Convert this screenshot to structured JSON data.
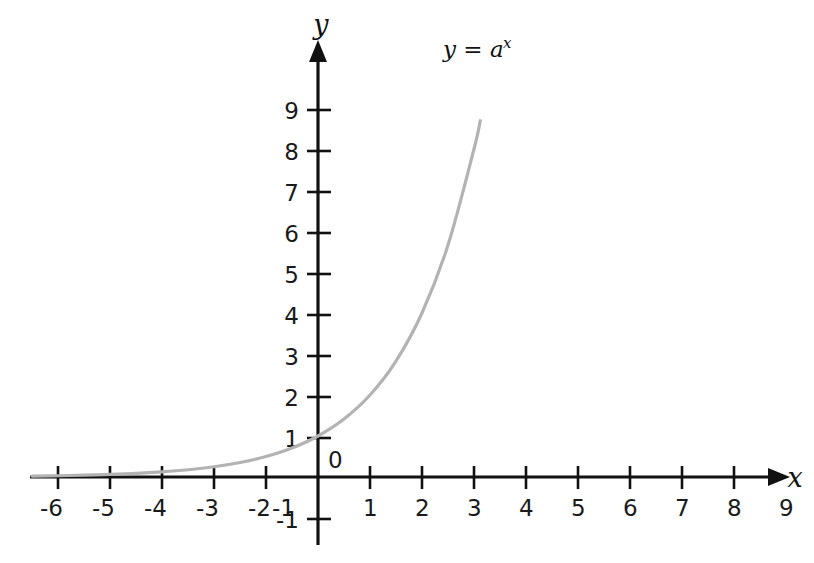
{
  "chart_data": {
    "type": "line",
    "title": "",
    "subtitle": "",
    "xlabel": "x",
    "ylabel": "y",
    "xlim": [
      -6.2,
      9.6
    ],
    "ylim": [
      -1.6,
      10.6
    ],
    "grid": false,
    "legend_position": "none",
    "origin_label": "0",
    "x_ticks": [
      -6,
      -5,
      -4,
      -3,
      -2,
      -1,
      1,
      2,
      3,
      4,
      5,
      6,
      7,
      8,
      9
    ],
    "x_tick_labels": [
      "-6",
      "-5",
      "-4",
      "-3",
      "-2",
      "-1",
      "1",
      "2",
      "3",
      "4",
      "5",
      "6",
      "7",
      "8",
      "9"
    ],
    "y_ticks": [
      -1,
      1,
      2,
      3,
      4,
      5,
      6,
      7,
      8,
      9
    ],
    "y_tick_labels": [
      "-1",
      "1",
      "2",
      "3",
      "4",
      "5",
      "6",
      "7",
      "8",
      "9"
    ],
    "series": [
      {
        "name": "y = a^x",
        "label_base": "y = a",
        "label_exponent": "x",
        "color": "#b3b3b3",
        "base": 2.0,
        "x": [
          -5.5,
          -5.0,
          -4.5,
          -4.0,
          -3.5,
          -3.0,
          -2.5,
          -2.0,
          -1.5,
          -1.0,
          -0.5,
          0.0,
          0.5,
          1.0,
          1.5,
          2.0,
          2.5,
          3.0,
          3.12
        ],
        "values": [
          0.022,
          0.031,
          0.044,
          0.063,
          0.088,
          0.125,
          0.177,
          0.25,
          0.354,
          0.5,
          0.707,
          1.0,
          1.414,
          2.0,
          2.828,
          4.0,
          5.657,
          8.0,
          8.69
        ]
      }
    ],
    "annotations": [
      {
        "text": "y = a^x",
        "x": 3.3,
        "y": 10.3
      }
    ]
  },
  "axes": {
    "x_axis_name": "x",
    "y_axis_name": "y",
    "x_arrow_icon": "arrow-right-icon",
    "y_arrow_icon": "arrow-up-icon"
  },
  "colors": {
    "background": "#ffffff",
    "axis": "#111111",
    "text": "#1a1a1a",
    "curve": "#b3b3b3"
  }
}
